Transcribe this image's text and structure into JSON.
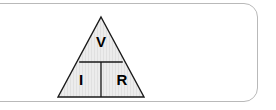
{
  "panel": {
    "background_color": "#ffffff",
    "border_color": "#b9b9b9",
    "corner_radius_px": 14
  },
  "figure": {
    "name": "ohms-law-triangle",
    "fill_color": "#e9e9e9",
    "stroke_color": "#1a1a1a",
    "divider_color": "#1a1a1a",
    "apex": {
      "x": 46,
      "y": 3
    },
    "base_left": {
      "x": 3,
      "y": 83
    },
    "base_right": {
      "x": 89,
      "y": 83
    },
    "horizontal_divider_y": 48,
    "vertical_divider_x": 46,
    "cells": [
      {
        "id": "numerator",
        "label": "V",
        "position": "top",
        "meaning": "voltage",
        "cx": 46,
        "cy": 28
      },
      {
        "id": "denominator-left",
        "label": "I",
        "position": "bottom-left",
        "meaning": "current",
        "cx": 26,
        "cy": 66
      },
      {
        "id": "denominator-right",
        "label": "R",
        "position": "bottom-right",
        "meaning": "resistance",
        "cx": 67,
        "cy": 66
      }
    ]
  }
}
